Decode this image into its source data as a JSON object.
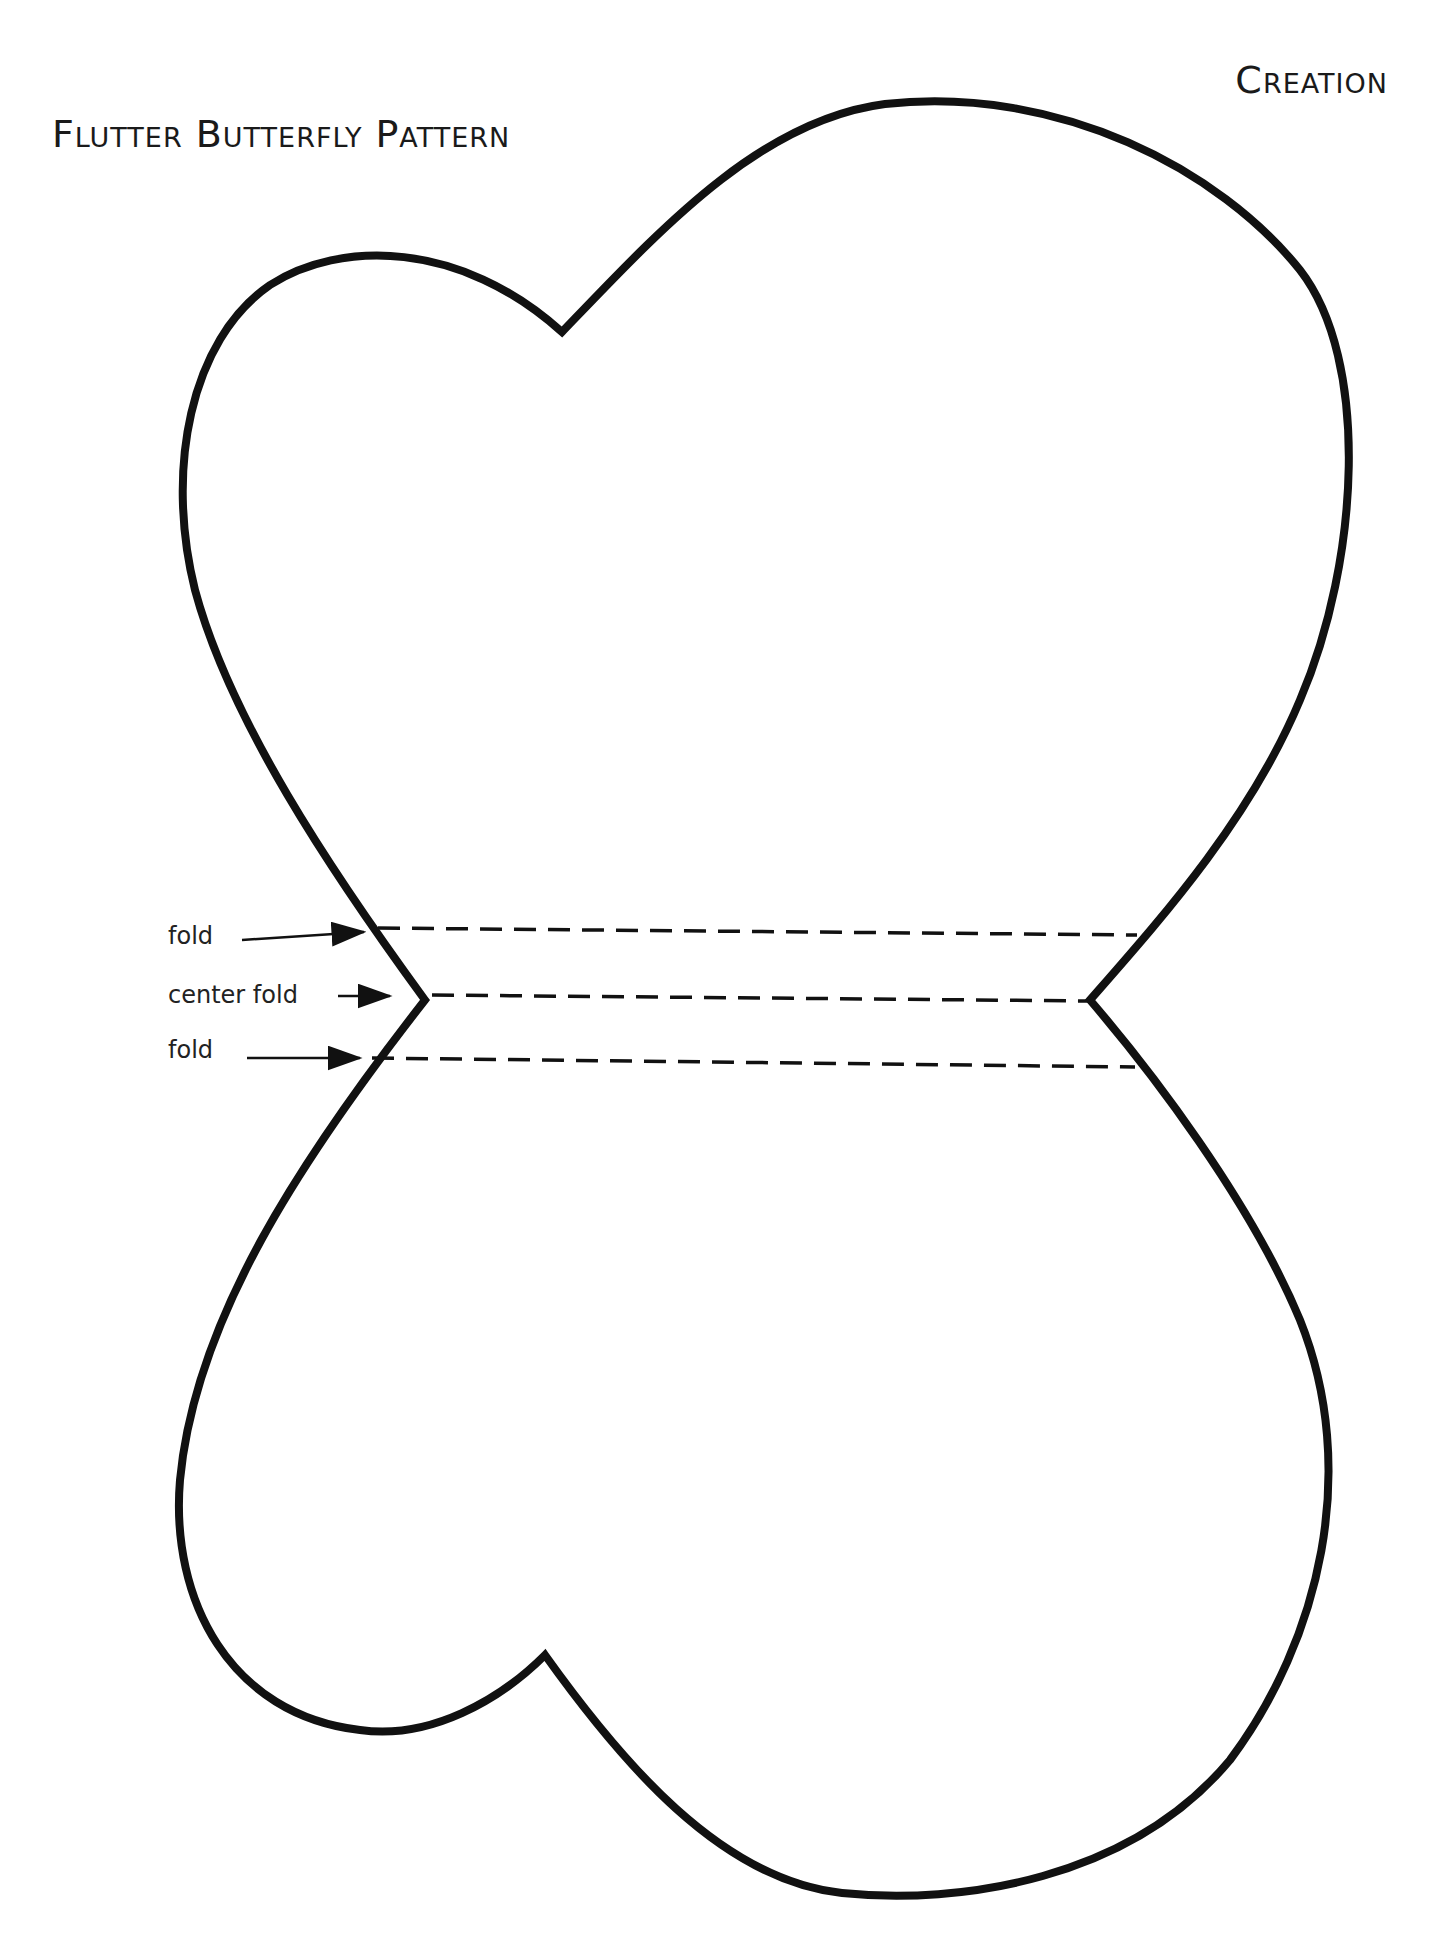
{
  "header": {
    "title": "Flutter Butterfly Pattern",
    "brand": "Creation"
  },
  "diagram": {
    "shape": "butterfly-outline",
    "stroke_color": "#111111",
    "fold_lines": [
      {
        "label": "fold",
        "kind": "fold"
      },
      {
        "label": "center fold",
        "kind": "center-fold"
      },
      {
        "label": "fold",
        "kind": "fold"
      }
    ]
  }
}
